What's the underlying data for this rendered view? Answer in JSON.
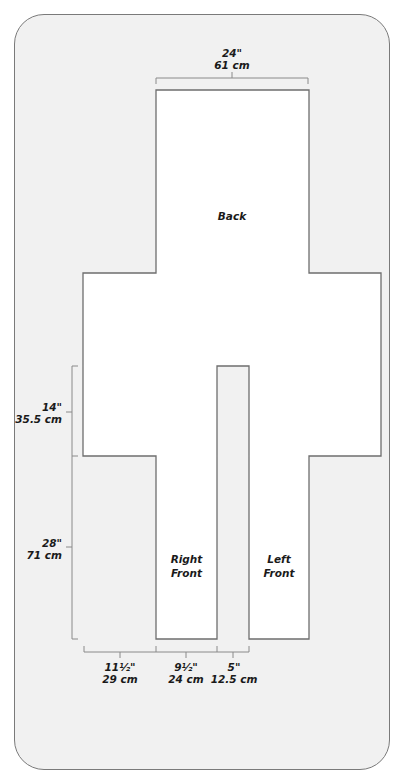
{
  "diagram": {
    "pieces": {
      "back": "Back",
      "right_front_1": "Right",
      "right_front_2": "Front",
      "left_front_1": "Left",
      "left_front_2": "Front"
    },
    "dimensions": {
      "top_width": {
        "imperial": "24\"",
        "metric": "61 cm"
      },
      "sleeve_height": {
        "imperial": "14\"",
        "metric": "35.5 cm"
      },
      "body_length": {
        "imperial": "28\"",
        "metric": "71 cm"
      },
      "sleeve_length": {
        "imperial": "11½\"",
        "metric": "29 cm"
      },
      "front_width": {
        "imperial": "9½\"",
        "metric": "24 cm"
      },
      "front_gap": {
        "imperial": "5\"",
        "metric": "12.5 cm"
      }
    },
    "colors": {
      "panel_bg": "#f1f1f1",
      "panel_border": "#7a7a7a",
      "piece_fill": "#ffffff",
      "piece_stroke": "#6e6e6e",
      "dim_line": "#8a8a8a",
      "text": "#1a1a1a"
    }
  }
}
